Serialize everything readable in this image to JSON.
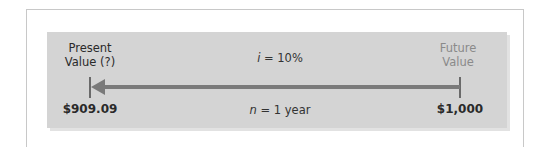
{
  "diagram": {
    "type": "timeline",
    "left": {
      "title_line1": "Present",
      "title_line2": "Value (?)",
      "amount": "$909.09"
    },
    "right": {
      "title_line1": "Future",
      "title_line2": "Value",
      "amount": "$1,000"
    },
    "rate": {
      "symbol": "i",
      "text": " = 10%"
    },
    "period": {
      "symbol": "n",
      "text": " = 1 year"
    },
    "arrow_direction": "right-to-left",
    "colors": {
      "panel": "#d4d4d4",
      "arrow": "#7a7a7a",
      "future_label": "#8a8a8a",
      "text": "#2a2a2a"
    }
  }
}
